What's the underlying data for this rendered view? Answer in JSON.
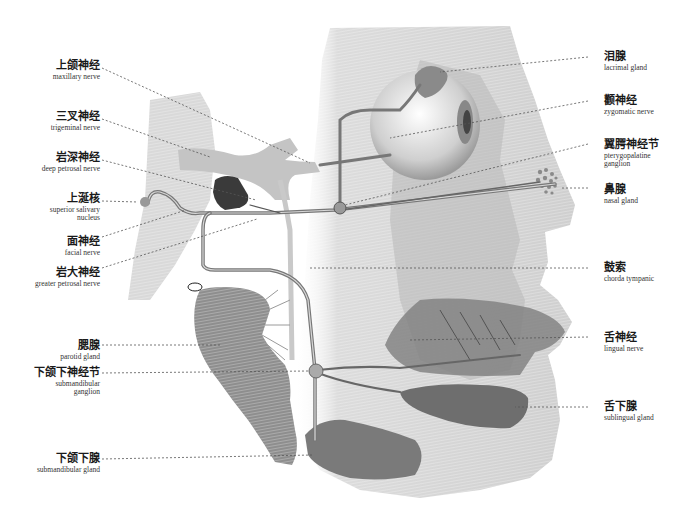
{
  "diagram": {
    "title": "",
    "colors": {
      "head_fill": "#d4d4d4",
      "tissue_dark": "#7a7a7a",
      "nerve": "#6a6a6a",
      "nerve_light": "#bdbdbd",
      "ganglion_dark": "#3a3a3a",
      "leader_line": "#555555"
    },
    "labels_left": [
      {
        "id": "maxillary-nerve",
        "zh": "上颌神经",
        "en": "maxillary nerve"
      },
      {
        "id": "trigeminal-nerve",
        "zh": "三叉神经",
        "en": "trigeminal nerve"
      },
      {
        "id": "deep-petrosal-nerve",
        "zh": "岩深神经",
        "en": "deep petrosal nerve"
      },
      {
        "id": "superior-salivary-nucleus",
        "zh": "上涎核",
        "en": "superior salivary",
        "en2": "nucleus"
      },
      {
        "id": "facial-nerve",
        "zh": "面神经",
        "en": "facial nerve"
      },
      {
        "id": "greater-petrosal-nerve",
        "zh": "岩大神经",
        "en": "greater petrosal nerve"
      },
      {
        "id": "parotid-gland",
        "zh": "腮腺",
        "en": "parotid gland"
      },
      {
        "id": "submandibular-ganglion",
        "zh": "下颌下神经节",
        "en": "submandibular",
        "en2": "ganglion"
      },
      {
        "id": "submandibular-gland",
        "zh": "下颌下腺",
        "en": "submandibular gland"
      }
    ],
    "labels_right": [
      {
        "id": "lacrimal-gland",
        "zh": "泪腺",
        "en": "lacrimal gland"
      },
      {
        "id": "zygomatic-nerve",
        "zh": "颧神经",
        "en": "zygomatic nerve"
      },
      {
        "id": "pterygopalatine-ganglion",
        "zh": "翼腭神经节",
        "en": "pterygopalatine",
        "en2": "ganglion"
      },
      {
        "id": "nasal-gland",
        "zh": "鼻腺",
        "en": "nasal gland"
      },
      {
        "id": "chorda-tympani",
        "zh": "鼓索",
        "en": "chorda tympanic"
      },
      {
        "id": "lingual-nerve",
        "zh": "舌神经",
        "en": "lingual nerve"
      },
      {
        "id": "sublingual-gland",
        "zh": "舌下腺",
        "en": "sublingual gland"
      }
    ]
  }
}
